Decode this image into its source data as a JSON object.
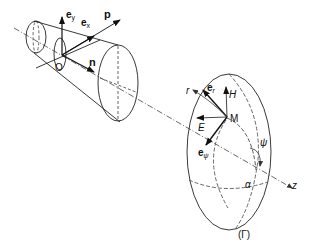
{
  "diagram": {
    "colors": {
      "stroke": "#222222",
      "background": "#ffffff",
      "dashed": "#555555"
    },
    "horn": {
      "origin_label": "O",
      "vectors": {
        "ey": {
          "base": "e",
          "sub": "y"
        },
        "ex": {
          "base": "e",
          "sub": "x"
        },
        "p": "p",
        "n": "n"
      }
    },
    "surface": {
      "point_label": "M",
      "field_labels": {
        "H": "H",
        "E": "E"
      },
      "vectors": {
        "er": {
          "base": "e",
          "sub": "r"
        },
        "epsi": {
          "base": "e",
          "sub": "ψ"
        },
        "r": "r"
      },
      "angle_labels": {
        "psi": "ψ",
        "alpha": "α"
      },
      "axis_label": "z",
      "surface_label": "(Γ)"
    }
  }
}
